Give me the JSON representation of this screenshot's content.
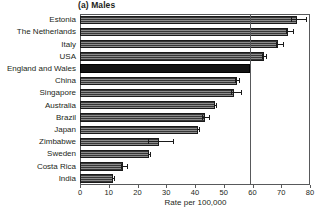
{
  "chart_data": {
    "type": "bar",
    "orientation": "horizontal",
    "title": "(a) Males",
    "xlabel": "Rate per 100,000",
    "ylabel": "",
    "xlim": [
      0,
      80
    ],
    "xticks": [
      0,
      10,
      20,
      30,
      40,
      50,
      60,
      70,
      80
    ],
    "grid": false,
    "legend": null,
    "reference_line": {
      "value": 59,
      "orientation": "vertical",
      "label": ""
    },
    "highlight_category": "England and Wales",
    "categories": [
      "Estonia",
      "The Netherlands",
      "Italy",
      "USA",
      "England and Wales",
      "China",
      "Singapore",
      "Australia",
      "Brazil",
      "Japan",
      "Zimbabwe",
      "Sweden",
      "Costa Rica",
      "India"
    ],
    "values": [
      75.5,
      72.5,
      69.0,
      64.0,
      59.0,
      54.5,
      53.5,
      47.0,
      43.5,
      41.0,
      27.5,
      24.0,
      15.0,
      11.5
    ],
    "errors_low": [
      73.5,
      71.5,
      68.0,
      63.3,
      59.0,
      53.8,
      52.5,
      46.6,
      42.5,
      40.6,
      23.5,
      23.6,
      14.4,
      11.2
    ],
    "errors_high": [
      78.5,
      74.0,
      70.5,
      64.8,
      59.0,
      55.3,
      56.0,
      47.4,
      45.0,
      41.4,
      32.5,
      24.4,
      16.2,
      11.9
    ],
    "colors": {
      "bar_fill": "#8c8c8c",
      "bar_hatch": "#282828",
      "bar_edge": "#1a1a1a",
      "highlight_fill": "#121212",
      "axis": "#58595b",
      "text": "#231f20",
      "background": "#ffffff"
    }
  }
}
